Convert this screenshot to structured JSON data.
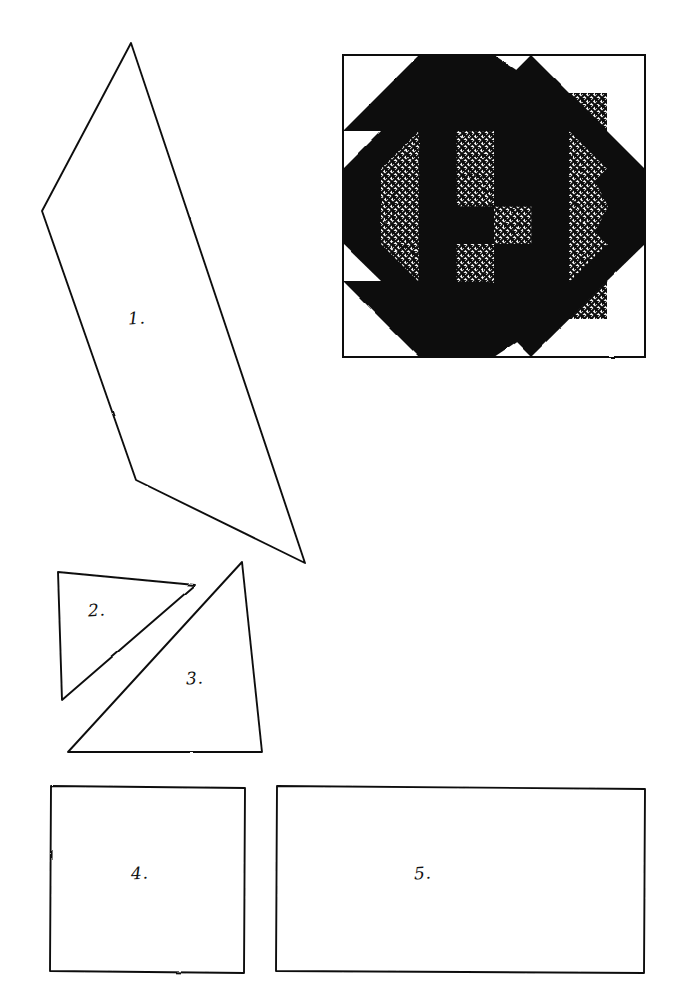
{
  "page": {
    "kind": "quilt-pattern-template-sheet",
    "background_color": "#ffffff",
    "ink_color": "#111111",
    "width": 687,
    "height": 1008
  },
  "block_diagram": {
    "name": "pieced star quilt block",
    "frame": {
      "x": 343,
      "y": 55,
      "width": 302,
      "height": 302,
      "stroke_color": "#111111",
      "stroke_width": 2,
      "fill_color": "#ffffff"
    },
    "fills": {
      "dark": "#111111",
      "light": "#ffffff",
      "crosshatch_ink": "#111111",
      "crosshatch_ground": "#ffffff"
    },
    "regions": [
      "octagon-center-dark",
      "outer-star-points-crosshatch",
      "inner-pinwheel-crosshatch",
      "center-four-patch",
      "corner-squares-light"
    ]
  },
  "pattern_pieces": [
    {
      "id": 1,
      "label": "1.",
      "shape": "elongated kite quadrilateral",
      "label_x": 128,
      "label_y": 308,
      "points": "131,43 42,211 136,480 305,563"
    },
    {
      "id": 2,
      "label": "2.",
      "shape": "right triangle",
      "label_x": 88,
      "label_y": 600,
      "points": "58,572 195,585 62,700"
    },
    {
      "id": 3,
      "label": "3.",
      "shape": "right triangle",
      "label_x": 186,
      "label_y": 668,
      "points": "242,562 262,752 68,752"
    },
    {
      "id": 4,
      "label": "4.",
      "shape": "square",
      "label_x": 131,
      "label_y": 863,
      "points": "51,786 245,788 244,973 50,971"
    },
    {
      "id": 5,
      "label": "5.",
      "shape": "rectangle",
      "label_x": 414,
      "label_y": 863,
      "points": "277,786 645,789 644,973 276,971"
    }
  ]
}
